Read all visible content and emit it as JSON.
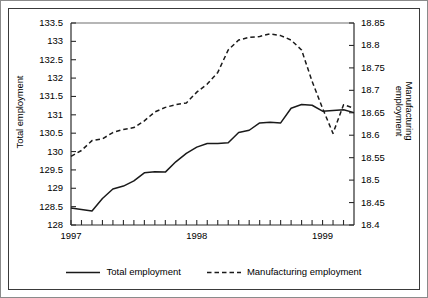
{
  "chart_data": {
    "type": "line",
    "title": "",
    "xlabel": "",
    "ylabel": "Total employment",
    "ylabel_right_line1": "Manufacturing",
    "ylabel_right_line2": "employment",
    "grid": false,
    "legend_position": "bottom",
    "x_tick_labels": [
      "1997",
      "1998",
      "1999"
    ],
    "x_tick_values": [
      1997,
      1998,
      1999
    ],
    "x_minor_ticks_per_year": 12,
    "xlim": [
      1997,
      1999.25
    ],
    "ylim_left": [
      128,
      133.5
    ],
    "y_left_ticks": [
      128,
      128.5,
      129,
      129.5,
      130,
      130.5,
      131,
      131.5,
      132,
      132.5,
      133,
      133.5
    ],
    "y_left_tick_labels": [
      "128",
      "128.5",
      "129",
      "129.5",
      "130",
      "130.5",
      "131",
      "131.5",
      "132",
      "132.5",
      "133",
      "133.5"
    ],
    "ylim_right": [
      18.4,
      18.85
    ],
    "y_right_ticks": [
      18.4,
      18.45,
      18.5,
      18.55,
      18.6,
      18.65,
      18.7,
      18.75,
      18.8,
      18.85
    ],
    "y_right_tick_labels": [
      "18.4",
      "18.45",
      "18.5",
      "18.55",
      "18.6",
      "18.65",
      "18.7",
      "18.75",
      "18.8",
      "18.85"
    ],
    "series": [
      {
        "name": "Total employment",
        "axis": "left",
        "style": "solid",
        "color": "#1a1a1a",
        "x": [
          1997.0,
          1997.083,
          1997.167,
          1997.25,
          1997.333,
          1997.417,
          1997.5,
          1997.583,
          1997.667,
          1997.75,
          1997.833,
          1997.917,
          1998.0,
          1998.083,
          1998.167,
          1998.25,
          1998.333,
          1998.417,
          1998.5,
          1998.583,
          1998.667,
          1998.75,
          1998.833,
          1998.917,
          1999.0,
          1999.083,
          1999.167,
          1999.25
        ],
        "values": [
          128.46,
          128.42,
          128.38,
          128.72,
          128.98,
          129.06,
          129.2,
          129.42,
          129.45,
          129.44,
          129.72,
          129.95,
          130.12,
          130.22,
          130.22,
          130.24,
          130.52,
          130.58,
          130.78,
          130.8,
          130.78,
          131.18,
          131.28,
          131.26,
          131.1,
          131.12,
          131.14,
          131.06
        ]
      },
      {
        "name": "Manufacturing employment",
        "axis": "right",
        "style": "dashed",
        "color": "#1a1a1a",
        "x": [
          1997.0,
          1997.083,
          1997.167,
          1997.25,
          1997.333,
          1997.417,
          1997.5,
          1997.583,
          1997.667,
          1997.75,
          1997.833,
          1997.917,
          1998.0,
          1998.083,
          1998.167,
          1998.25,
          1998.333,
          1998.417,
          1998.5,
          1998.583,
          1998.667,
          1998.75,
          1998.833,
          1998.917,
          1999.0,
          1999.083,
          1999.167,
          1999.25
        ],
        "values": [
          18.553,
          18.566,
          18.588,
          18.592,
          18.606,
          18.613,
          18.617,
          18.632,
          18.652,
          18.662,
          18.668,
          18.672,
          18.696,
          18.714,
          18.74,
          18.79,
          18.812,
          18.818,
          18.82,
          18.826,
          18.822,
          18.812,
          18.79,
          18.72,
          18.66,
          18.604,
          18.668,
          18.66
        ]
      }
    ],
    "legend": [
      {
        "label": "Total employment",
        "style": "solid"
      },
      {
        "label": "Manufacturing employment",
        "style": "dashed"
      }
    ]
  }
}
